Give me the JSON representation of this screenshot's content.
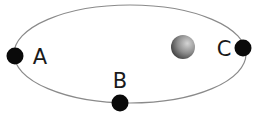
{
  "diagram": {
    "type": "elliptical-orbit",
    "orbit": {
      "cx": 130,
      "cy": 54,
      "rx": 116,
      "ry": 49,
      "stroke": "#8a8a8a"
    },
    "central_body": {
      "cx": 183,
      "cy": 47,
      "r": 12,
      "color_light": "#c9c9c9",
      "color_dark": "#4a4a4a"
    },
    "points": [
      {
        "id": "A",
        "label": "A",
        "cx": 15,
        "cy": 56,
        "r": 8.5,
        "label_x": 40,
        "label_y": 64
      },
      {
        "id": "B",
        "label": "B",
        "cx": 120,
        "cy": 103,
        "r": 8.5,
        "label_x": 120,
        "label_y": 88
      },
      {
        "id": "C",
        "label": "C",
        "cx": 243,
        "cy": 48,
        "r": 8.5,
        "label_x": 224,
        "label_y": 56
      }
    ],
    "point_color": "#0a0a0a"
  }
}
